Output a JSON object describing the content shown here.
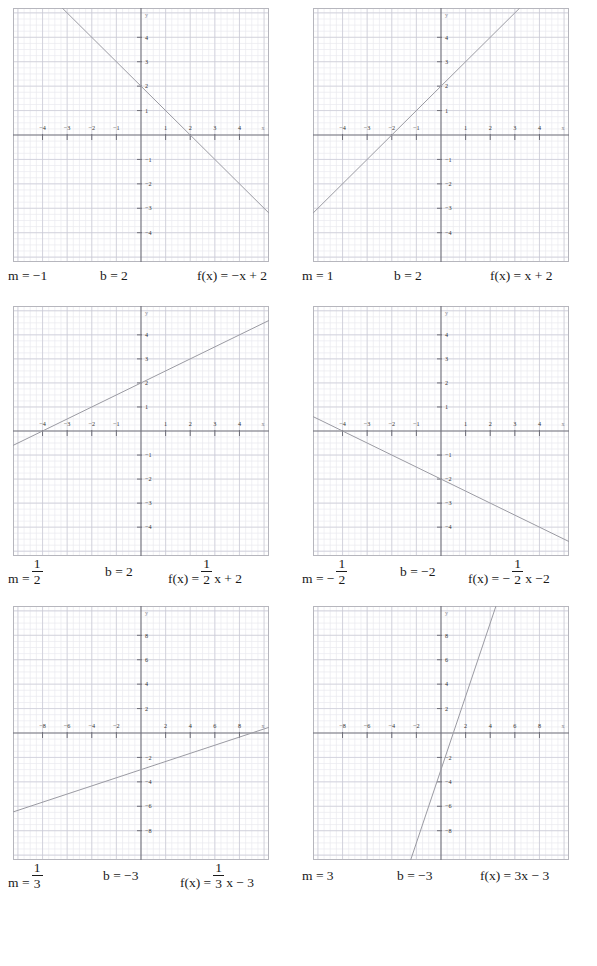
{
  "page": {
    "background": "#ffffff",
    "ink": "#1a1a1a",
    "grid_minor_color": "#e9e9ef",
    "grid_major_color": "#c9c9d4",
    "axis_color": "#6e6e78",
    "line_color": "#9a9aa2",
    "border_color": "#b6b6bd"
  },
  "panels": [
    {
      "id": "panel-1",
      "m_label": "m = −1",
      "b_label": "b = 2",
      "f_prefix": "f(x) = −x + 2",
      "has_fraction": false,
      "chart_data": {
        "type": "line",
        "title": "f(x) = −x + 2",
        "xlabel": "x",
        "ylabel": "y",
        "slope": -1,
        "intercept": 2,
        "xlim": [
          -5.2,
          5.2
        ],
        "ylim": [
          -5.2,
          5.2
        ],
        "xticks": [
          -4,
          -3,
          -2,
          -1,
          1,
          2,
          3,
          4
        ],
        "yticks": [
          -4,
          -3,
          -2,
          -1,
          1,
          2,
          3,
          4
        ],
        "xtick_labels": [
          "−4",
          "−3",
          "−2",
          "−1",
          "1",
          "2",
          "3",
          "4"
        ],
        "ytick_labels": [
          "−4",
          "−3",
          "−2",
          "−1",
          "1",
          "2",
          "3",
          "4"
        ],
        "grid": true,
        "minor_per_unit": 4,
        "x_intercept": 2,
        "points": [
          [
            -3,
            5
          ],
          [
            0,
            2
          ],
          [
            2,
            0
          ],
          [
            5,
            -3
          ]
        ]
      }
    },
    {
      "id": "panel-2",
      "m_label": "m = 1",
      "b_label": "b = 2",
      "f_prefix": "f(x) = x + 2",
      "has_fraction": false,
      "chart_data": {
        "type": "line",
        "title": "f(x) = x + 2",
        "xlabel": "x",
        "ylabel": "y",
        "slope": 1,
        "intercept": 2,
        "xlim": [
          -5.2,
          5.2
        ],
        "ylim": [
          -5.2,
          5.2
        ],
        "xticks": [
          -4,
          -3,
          -2,
          -1,
          1,
          2,
          3,
          4
        ],
        "yticks": [
          -4,
          -3,
          -2,
          -1,
          1,
          2,
          3,
          4
        ],
        "xtick_labels": [
          "−4",
          "−3",
          "−2",
          "−1",
          "1",
          "2",
          "3",
          "4"
        ],
        "ytick_labels": [
          "−4",
          "−3",
          "−2",
          "−1",
          "1",
          "2",
          "3",
          "4"
        ],
        "grid": true,
        "minor_per_unit": 4,
        "x_intercept": -2,
        "points": [
          [
            -5,
            -3
          ],
          [
            -2,
            0
          ],
          [
            0,
            2
          ],
          [
            3,
            5
          ]
        ]
      }
    },
    {
      "id": "panel-3",
      "m_label": "m =",
      "m_num": "1",
      "m_den": "2",
      "b_label": "b = 2",
      "f_prefix": "f(x) =",
      "f_num": "1",
      "f_den": "2",
      "f_suffix": "x + 2",
      "has_fraction": true,
      "chart_data": {
        "type": "line",
        "title": "f(x) = 1/2 x + 2",
        "xlabel": "x",
        "ylabel": "y",
        "slope": 0.5,
        "intercept": 2,
        "xlim": [
          -5.2,
          5.2
        ],
        "ylim": [
          -5.2,
          5.2
        ],
        "xticks": [
          -4,
          -3,
          -2,
          -1,
          1,
          2,
          3,
          4
        ],
        "yticks": [
          -4,
          -3,
          -2,
          -1,
          1,
          2,
          3,
          4
        ],
        "xtick_labels": [
          "−4",
          "−3",
          "−2",
          "−1",
          "1",
          "2",
          "3",
          "4"
        ],
        "ytick_labels": [
          "−4",
          "−3",
          "−2",
          "−1",
          "1",
          "2",
          "3",
          "4"
        ],
        "grid": true,
        "minor_per_unit": 4,
        "x_intercept": -4,
        "points": [
          [
            -5,
            -0.5
          ],
          [
            -4,
            0
          ],
          [
            0,
            2
          ],
          [
            5,
            4.5
          ]
        ]
      }
    },
    {
      "id": "panel-4",
      "m_label": "m = −",
      "m_num": "1",
      "m_den": "2",
      "b_label": "b = −2",
      "f_prefix": "f(x) = −",
      "f_num": "1",
      "f_den": "2",
      "f_suffix": "x −2",
      "has_fraction": true,
      "chart_data": {
        "type": "line",
        "title": "f(x) = −1/2 x − 2",
        "xlabel": "x",
        "ylabel": "y",
        "slope": -0.5,
        "intercept": -2,
        "xlim": [
          -5.2,
          5.2
        ],
        "ylim": [
          -5.2,
          5.2
        ],
        "xticks": [
          -4,
          -3,
          -2,
          -1,
          1,
          2,
          3,
          4
        ],
        "yticks": [
          -4,
          -3,
          -2,
          -1,
          1,
          2,
          3,
          4
        ],
        "xtick_labels": [
          "−4",
          "−3",
          "−2",
          "−1",
          "1",
          "2",
          "3",
          "4"
        ],
        "ytick_labels": [
          "−4",
          "−3",
          "−2",
          "−1",
          "1",
          "2",
          "3",
          "4"
        ],
        "grid": true,
        "minor_per_unit": 4,
        "x_intercept": -4,
        "points": [
          [
            -5,
            0.5
          ],
          [
            -4,
            0
          ],
          [
            0,
            -2
          ],
          [
            5,
            -4.5
          ]
        ]
      }
    },
    {
      "id": "panel-5",
      "m_label": "m =",
      "m_num": "1",
      "m_den": "3",
      "b_label": "b = −3",
      "f_prefix": "f(x) =",
      "f_num": "1",
      "f_den": "3",
      "f_suffix": "x − 3",
      "has_fraction": true,
      "chart_data": {
        "type": "line",
        "title": "f(x) = 1/3 x − 3",
        "xlabel": "x",
        "ylabel": "y",
        "slope": 0.3333333,
        "intercept": -3,
        "xlim": [
          -10.4,
          10.4
        ],
        "ylim": [
          -10.4,
          10.4
        ],
        "xticks": [
          -8,
          -6,
          -4,
          -2,
          2,
          4,
          6,
          8
        ],
        "yticks": [
          -8,
          -6,
          -4,
          -2,
          2,
          4,
          6,
          8
        ],
        "xtick_labels": [
          "−8",
          "−6",
          "−4",
          "−2",
          "2",
          "4",
          "6",
          "8"
        ],
        "ytick_labels": [
          "−8",
          "−6",
          "−4",
          "−2",
          "2",
          "4",
          "6",
          "8"
        ],
        "grid": true,
        "minor_per_unit": 2,
        "x_intercept": 9,
        "points": [
          [
            -10,
            -6.33
          ],
          [
            0,
            -3
          ],
          [
            9,
            0
          ],
          [
            10,
            0.33
          ]
        ]
      }
    },
    {
      "id": "panel-6",
      "m_label": "m = 3",
      "b_label": "b = −3",
      "f_prefix": "f(x) = 3x − 3",
      "has_fraction": false,
      "chart_data": {
        "type": "line",
        "title": "f(x) = 3x − 3",
        "xlabel": "x",
        "ylabel": "y",
        "slope": 3,
        "intercept": -3,
        "xlim": [
          -10.4,
          10.4
        ],
        "ylim": [
          -10.4,
          10.4
        ],
        "xticks": [
          -8,
          -6,
          -4,
          -2,
          2,
          4,
          6,
          8
        ],
        "yticks": [
          -8,
          -6,
          -4,
          -2,
          2,
          4,
          6,
          8
        ],
        "xtick_labels": [
          "−8",
          "−6",
          "−4",
          "−2",
          "2",
          "4",
          "6",
          "8"
        ],
        "ytick_labels": [
          "−8",
          "−6",
          "−4",
          "−2",
          "2",
          "4",
          "6",
          "8"
        ],
        "grid": true,
        "minor_per_unit": 2,
        "x_intercept": 1,
        "points": [
          [
            -2.33,
            -10
          ],
          [
            0,
            -3
          ],
          [
            1,
            0
          ],
          [
            4.33,
            10
          ]
        ]
      }
    }
  ]
}
